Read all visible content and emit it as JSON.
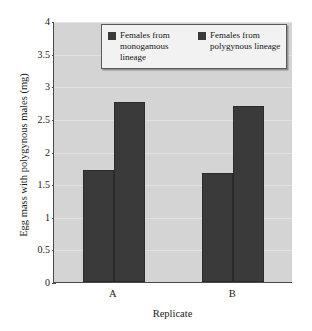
{
  "chart_data": {
    "type": "bar",
    "title": "",
    "xlabel": "Replicate",
    "ylabel": "Egg mass with polygynous males (mg)",
    "categories": [
      "A",
      "B"
    ],
    "series": [
      {
        "name": "Females from monogamous lineage",
        "color": "#3a3a3a",
        "values": [
          1.72,
          1.67
        ]
      },
      {
        "name": "Females from polygynous lineage",
        "color": "#3a3a3a",
        "values": [
          2.76,
          2.7
        ]
      }
    ],
    "ylim": [
      0,
      4
    ],
    "yticks": [
      0,
      0.5,
      1,
      1.5,
      2,
      2.5,
      3,
      3.5,
      4
    ],
    "ytick_labels": [
      "0",
      "0.5",
      "1",
      "1.5",
      "2",
      "2.5",
      "3",
      "3.5",
      "4"
    ],
    "grid": true,
    "legend_position": "top-center",
    "plot_background": "#d4d4d4",
    "bar_color": "#3a3a3a"
  },
  "legend": {
    "entries": [
      {
        "label": "Females from monogamous lineage"
      },
      {
        "label": "Females from polygynous lineage"
      }
    ]
  }
}
